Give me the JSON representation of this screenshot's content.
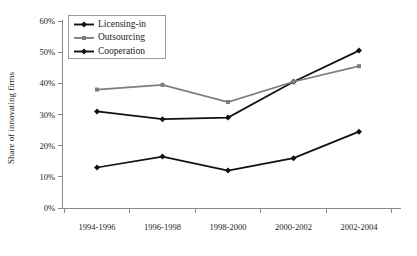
{
  "chart_data": {
    "type": "line",
    "title": "",
    "xlabel": "",
    "ylabel": "Share of innovating firms",
    "categories": [
      "1994-1996",
      "1996-1998",
      "1998-2000",
      "2000-2002",
      "2002-2004"
    ],
    "ylim": [
      0,
      60
    ],
    "ytick_values": [
      0,
      10,
      20,
      30,
      40,
      50,
      60
    ],
    "ytick_labels": [
      "0%",
      "10%",
      "20%",
      "30%",
      "40%",
      "50%",
      "60%"
    ],
    "grid": false,
    "legend_position": "top-left",
    "series": [
      {
        "name": "Licensing-in",
        "color": "#111111",
        "marker": "diamond",
        "values": [
          31,
          28.5,
          29,
          40.5,
          50.5
        ]
      },
      {
        "name": "Outsourcing",
        "color": "#7d7d7d",
        "marker": "square",
        "values": [
          38,
          39.5,
          34,
          40.5,
          45.5
        ]
      },
      {
        "name": "Cooperation",
        "color": "#111111",
        "marker": "diamond",
        "values": [
          13,
          16.5,
          12,
          16,
          24.5
        ]
      }
    ]
  },
  "axes": {
    "y_title": "Share of innovating firms"
  },
  "legend": {
    "items": [
      {
        "label": "Licensing-in"
      },
      {
        "label": "Outsourcing"
      },
      {
        "label": "Cooperation"
      }
    ]
  },
  "colors": {
    "licensing_in": "#111111",
    "outsourcing": "#7d7d7d",
    "cooperation": "#111111",
    "axis": "#8a8a8a",
    "background": "#ffffff"
  }
}
